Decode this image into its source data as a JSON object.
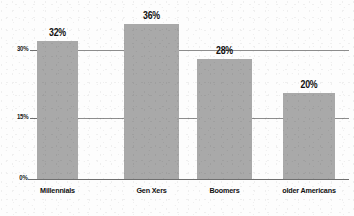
{
  "chart_data": {
    "type": "bar",
    "title": "",
    "subtitle": "",
    "xlabel": "",
    "ylabel": "",
    "categories": [
      "Millennials",
      "Gen Xers",
      "Boomers",
      "older Americans"
    ],
    "values": [
      32,
      36,
      28,
      20
    ],
    "value_labels": [
      "32%",
      "36%",
      "28%",
      "20%"
    ],
    "ylim": [
      0,
      40
    ],
    "ytick_values": [
      0,
      15,
      30
    ],
    "ytick_labels": [
      "0%",
      "15%",
      "30%"
    ],
    "grid": true,
    "grid_axis": "y",
    "legend": false,
    "legend_position": "none",
    "bar_color": "#a9a9a9",
    "axis_color": "#6f6f6f",
    "grid_color": "#8d8d8d",
    "text_color": "#111111",
    "background_color": "#fdfdfd"
  },
  "axes": {
    "yticks": [
      {
        "label": "30%",
        "value": 30
      },
      {
        "label": "15%",
        "value": 15
      },
      {
        "label": "0%",
        "value": 0
      }
    ]
  },
  "bars": [
    {
      "category": "Millennials",
      "value": 32,
      "label": "32%"
    },
    {
      "category": "Gen Xers",
      "value": 36,
      "label": "36%"
    },
    {
      "category": "Boomers",
      "value": 28,
      "label": "28%"
    },
    {
      "category": "older Americans",
      "value": 20,
      "label": "20%"
    }
  ]
}
